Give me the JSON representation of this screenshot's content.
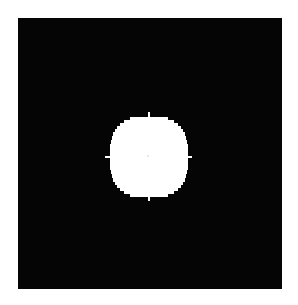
{
  "image": {
    "description": "Binary image: white pixelated disk centered on a black square field",
    "background_color": "#ffffff",
    "field_color": "#050505",
    "disk_color": "#ffffff",
    "center_dot_color": "#e6e6e6"
  },
  "field": {
    "x": 18,
    "y": 18,
    "width": 264,
    "height": 271
  },
  "disk": {
    "cx": 149,
    "cy": 156.5,
    "rx": 39,
    "ry": 39.5,
    "ticks": [
      "top",
      "right",
      "bottom",
      "left"
    ]
  }
}
